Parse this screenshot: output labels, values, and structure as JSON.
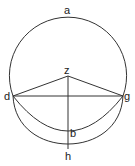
{
  "diagram": {
    "type": "geometric-construction",
    "labels": {
      "a": "a",
      "z": "z",
      "d": "d",
      "g": "g",
      "b": "b",
      "h": "h"
    },
    "points": {
      "a": [
        68,
        17
      ],
      "z": [
        68,
        75
      ],
      "d": [
        13,
        96
      ],
      "g": [
        123,
        96
      ],
      "b": [
        68,
        131
      ],
      "h": [
        68,
        148
      ]
    },
    "elements": [
      {
        "type": "arc",
        "name": "upper-circle-arc",
        "through": [
          "d",
          "a",
          "g"
        ]
      },
      {
        "type": "arc",
        "name": "inner-lower-arc",
        "through": [
          "d",
          "b",
          "g"
        ]
      },
      {
        "type": "arc",
        "name": "outer-lower-arc",
        "through": [
          "d",
          "h",
          "g"
        ]
      },
      {
        "type": "segment",
        "from": "d",
        "to": "g"
      },
      {
        "type": "segment",
        "from": "z",
        "to": "d"
      },
      {
        "type": "segment",
        "from": "z",
        "to": "g"
      },
      {
        "type": "segment",
        "from": "z",
        "to": "h"
      }
    ],
    "stroke_color": "#333333",
    "background": "#ffffff"
  }
}
